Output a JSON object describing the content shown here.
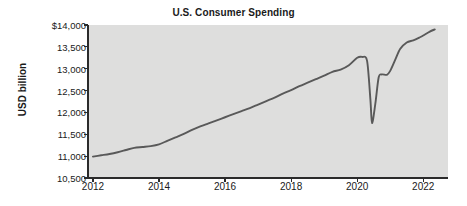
{
  "chart_data": {
    "type": "line",
    "title": "U.S. Consumer Spending",
    "xlabel": "",
    "ylabel": "USD billion",
    "xlim": [
      2011.85,
      2022.75
    ],
    "ylim": [
      10500,
      14000
    ],
    "grid": false,
    "legend": "none",
    "x_ticks": [
      2012,
      2014,
      2016,
      2018,
      2020,
      2022
    ],
    "x_tick_labels": [
      "2012",
      "2014",
      "2016",
      "2018",
      "2020",
      "2022"
    ],
    "y_ticks": [
      10500,
      11000,
      11500,
      12000,
      12500,
      13000,
      13500,
      14000
    ],
    "y_tick_labels": [
      "10,500",
      "11,000",
      "11,500",
      "12,000",
      "12,500",
      "13,000",
      "13,500",
      "$14,000"
    ],
    "series": [
      {
        "name": "U.S. Consumer Spending",
        "color": "#595959",
        "x": [
          2012.0,
          2012.25,
          2012.5,
          2012.75,
          2013.0,
          2013.25,
          2013.5,
          2013.75,
          2014.0,
          2014.25,
          2014.5,
          2014.75,
          2015.0,
          2015.25,
          2015.5,
          2015.75,
          2016.0,
          2016.25,
          2016.5,
          2016.75,
          2017.0,
          2017.25,
          2017.5,
          2017.75,
          2018.0,
          2018.25,
          2018.5,
          2018.75,
          2019.0,
          2019.25,
          2019.5,
          2019.75,
          2020.0,
          2020.15,
          2020.3,
          2020.4,
          2020.45,
          2020.55,
          2020.65,
          2020.75,
          2020.9,
          2021.0,
          2021.15,
          2021.3,
          2021.5,
          2021.7,
          2021.9,
          2022.0,
          2022.2,
          2022.35
        ],
        "y": [
          10990,
          11020,
          11050,
          11090,
          11140,
          11190,
          11210,
          11230,
          11270,
          11350,
          11430,
          11510,
          11600,
          11680,
          11750,
          11820,
          11890,
          11960,
          12030,
          12100,
          12180,
          12260,
          12340,
          12430,
          12510,
          12600,
          12680,
          12760,
          12840,
          12930,
          12980,
          13080,
          13250,
          13270,
          13180,
          12300,
          11760,
          12200,
          12800,
          12870,
          12860,
          12950,
          13200,
          13450,
          13600,
          13650,
          13720,
          13760,
          13850,
          13900
        ]
      }
    ],
    "annotations": []
  },
  "style": {
    "plot_background": "#dededd",
    "axis_color": "#2b2b2b",
    "line_color": "#595959",
    "text_color": "#1a1a1a",
    "page_background": "#ffffff"
  }
}
